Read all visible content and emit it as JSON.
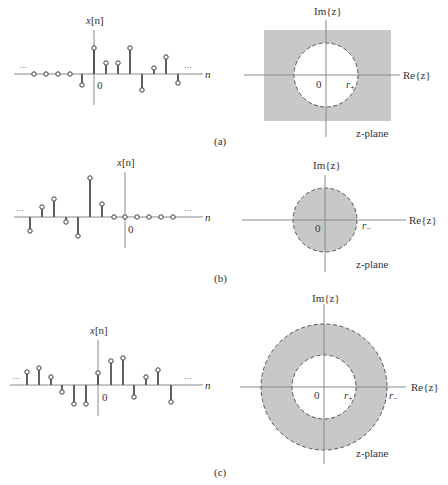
{
  "colors": {
    "background": "#ffffff",
    "roc_fill": "#c8c8c8",
    "axis": "#8a8a8a",
    "stem": "#3a3a3a",
    "boundary": "#555555"
  },
  "panels": [
    {
      "id": "a",
      "caption": "(a)",
      "sequence": {
        "y_label_main": "x",
        "y_label_arg": "[n]",
        "x_label": "n",
        "origin_label": "0",
        "left_ellipsis": "···",
        "right_ellipsis": "···",
        "description": "right-sided sequence"
      },
      "zplane": {
        "im_label": "Im{z}",
        "re_label": "Re{z}",
        "origin_label": "0",
        "radius_label": "r",
        "radius_sub": "+",
        "plane_label": "z-plane",
        "roc": "|z| > r+ (exterior of circle)"
      }
    },
    {
      "id": "b",
      "caption": "(b)",
      "sequence": {
        "y_label_main": "x",
        "y_label_arg": "[n]",
        "x_label": "n",
        "origin_label": "0",
        "left_ellipsis": "···",
        "right_ellipsis": "···",
        "description": "left-sided sequence"
      },
      "zplane": {
        "im_label": "Im{z}",
        "re_label": "Re{z}",
        "origin_label": "0",
        "radius_label": "r",
        "radius_sub": "−",
        "plane_label": "z-plane",
        "roc": "|z| < r− (interior of circle)"
      }
    },
    {
      "id": "c",
      "caption": "(c)",
      "sequence": {
        "y_label_main": "x",
        "y_label_arg": "[n]",
        "x_label": "n",
        "origin_label": "0",
        "left_ellipsis": "···",
        "right_ellipsis": "···",
        "description": "two-sided sequence"
      },
      "zplane": {
        "im_label": "Im{z}",
        "re_label": "Re{z}",
        "origin_label": "0",
        "inner_radius_label": "r",
        "inner_radius_sub": "+",
        "outer_radius_label": "r",
        "outer_radius_sub": "−",
        "plane_label": "z-plane",
        "roc": "r+ < |z| < r− (annulus)"
      }
    }
  ]
}
